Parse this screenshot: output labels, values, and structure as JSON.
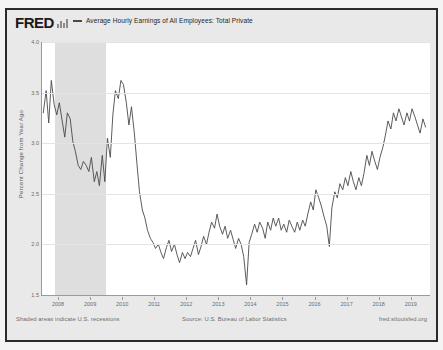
{
  "branding": {
    "logo_text": "FRED",
    "logo_icon": "bar-chart-icon"
  },
  "legend": {
    "series_label": "Average Hourly Earnings of All Employees: Total Private",
    "line_color": "#4a4a4a"
  },
  "footer": {
    "left_note": "Shaded areas indicate U.S. recessions",
    "source": "Source: U.S. Bureau of Labor Statistics",
    "url": "fred.stlouisfed.org"
  },
  "colors": {
    "frame": "#2b2b2b",
    "panel_bg": "#e9e9e9",
    "plot_bg": "#ffffff",
    "gridline": "#e4e4e4",
    "recession_band": "#dedede",
    "axis": "#9a9a9a",
    "tick_text": "#6a6a6a"
  },
  "chart_data": {
    "type": "line",
    "title": "Average Hourly Earnings of All Employees: Total Private",
    "xlabel": "",
    "ylabel": "Percent Change from Year Ago",
    "ylim": [
      1.5,
      4.0
    ],
    "xlim": [
      2007.5,
      2019.6
    ],
    "grid": true,
    "legend_position": "top",
    "ytick_labels": [
      "4.0",
      "3.5",
      "3.0",
      "2.5",
      "2.0",
      "1.5"
    ],
    "ytick_values": [
      4.0,
      3.5,
      3.0,
      2.5,
      2.0,
      1.5
    ],
    "xtick_labels": [
      "2008",
      "2009",
      "2010",
      "2011",
      "2012",
      "2013",
      "2014",
      "2015",
      "2016",
      "2017",
      "2018",
      "2019"
    ],
    "xtick_values": [
      2008,
      2009,
      2010,
      2011,
      2012,
      2013,
      2014,
      2015,
      2016,
      2017,
      2018,
      2019
    ],
    "recessions": [
      {
        "start": 2007.92,
        "end": 2009.5
      }
    ],
    "series": [
      {
        "name": "Average Hourly Earnings of All Employees: Total Private",
        "color": "#4a4a4a",
        "x": [
          2007.54,
          2007.63,
          2007.71,
          2007.79,
          2007.88,
          2007.96,
          2008.04,
          2008.13,
          2008.21,
          2008.29,
          2008.38,
          2008.46,
          2008.54,
          2008.63,
          2008.71,
          2008.79,
          2008.88,
          2008.96,
          2009.04,
          2009.13,
          2009.21,
          2009.29,
          2009.38,
          2009.46,
          2009.54,
          2009.63,
          2009.71,
          2009.79,
          2009.88,
          2009.96,
          2010.04,
          2010.13,
          2010.21,
          2010.29,
          2010.38,
          2010.46,
          2010.54,
          2010.63,
          2010.71,
          2010.79,
          2010.88,
          2010.96,
          2011.04,
          2011.13,
          2011.21,
          2011.29,
          2011.38,
          2011.46,
          2011.54,
          2011.63,
          2011.71,
          2011.79,
          2011.88,
          2011.96,
          2012.04,
          2012.13,
          2012.21,
          2012.29,
          2012.38,
          2012.46,
          2012.54,
          2012.63,
          2012.71,
          2012.79,
          2012.88,
          2012.96,
          2013.04,
          2013.13,
          2013.21,
          2013.29,
          2013.38,
          2013.46,
          2013.54,
          2013.63,
          2013.71,
          2013.79,
          2013.88,
          2013.96,
          2014.04,
          2014.13,
          2014.21,
          2014.29,
          2014.38,
          2014.46,
          2014.54,
          2014.63,
          2014.71,
          2014.79,
          2014.88,
          2014.96,
          2015.04,
          2015.13,
          2015.21,
          2015.29,
          2015.38,
          2015.46,
          2015.54,
          2015.63,
          2015.71,
          2015.79,
          2015.88,
          2015.96,
          2016.04,
          2016.13,
          2016.21,
          2016.29,
          2016.38,
          2016.46,
          2016.54,
          2016.63,
          2016.71,
          2016.79,
          2016.88,
          2016.96,
          2017.04,
          2017.13,
          2017.21,
          2017.29,
          2017.38,
          2017.46,
          2017.54,
          2017.63,
          2017.71,
          2017.79,
          2017.88,
          2017.96,
          2018.04,
          2018.13,
          2018.21,
          2018.29,
          2018.38,
          2018.46,
          2018.54,
          2018.63,
          2018.71,
          2018.79,
          2018.88,
          2018.96,
          2019.04,
          2019.13,
          2019.21,
          2019.29,
          2019.38,
          2019.46
        ],
        "y": [
          3.3,
          3.52,
          3.2,
          3.62,
          3.38,
          3.28,
          3.4,
          3.22,
          3.06,
          3.3,
          3.24,
          3.02,
          2.92,
          2.78,
          2.74,
          2.82,
          2.78,
          2.72,
          2.86,
          2.62,
          2.72,
          2.58,
          2.88,
          2.62,
          3.05,
          2.86,
          3.28,
          3.52,
          3.44,
          3.62,
          3.58,
          3.4,
          3.18,
          3.36,
          3.1,
          2.8,
          2.52,
          2.34,
          2.26,
          2.14,
          2.06,
          2.02,
          1.96,
          2.0,
          1.92,
          1.86,
          1.97,
          2.04,
          1.93,
          2.0,
          1.9,
          1.82,
          1.92,
          1.86,
          1.92,
          1.88,
          1.96,
          2.04,
          1.9,
          1.98,
          2.08,
          2.0,
          2.12,
          2.22,
          2.16,
          2.3,
          2.18,
          2.1,
          2.18,
          2.06,
          2.14,
          2.05,
          1.96,
          2.06,
          2.0,
          1.88,
          1.6,
          2.02,
          2.1,
          2.2,
          2.12,
          2.22,
          2.16,
          2.06,
          2.22,
          2.14,
          2.26,
          2.18,
          2.26,
          2.14,
          2.2,
          2.12,
          2.24,
          2.18,
          2.12,
          2.22,
          2.14,
          2.24,
          2.18,
          2.3,
          2.42,
          2.34,
          2.54,
          2.46,
          2.38,
          2.28,
          2.18,
          1.98,
          2.36,
          2.52,
          2.46,
          2.6,
          2.54,
          2.66,
          2.58,
          2.72,
          2.62,
          2.54,
          2.66,
          2.58,
          2.7,
          2.88,
          2.78,
          2.92,
          2.82,
          2.74,
          2.86,
          2.96,
          3.08,
          3.22,
          3.14,
          3.3,
          3.22,
          3.34,
          3.26,
          3.18,
          3.3,
          3.22,
          3.34,
          3.26,
          3.18,
          3.1,
          3.24,
          3.16
        ]
      }
    ]
  }
}
